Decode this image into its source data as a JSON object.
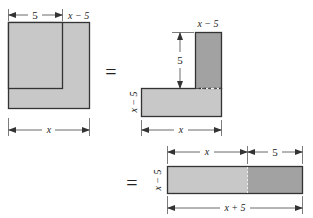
{
  "colors": {
    "light_fill": "#c8c8c8",
    "dark_fill": "#a2a2a2",
    "stroke": "#333333",
    "dim_line": "#444444"
  },
  "figure1": {
    "dim_top": "5",
    "dim_corner": "x − 5",
    "dim_bottom": "x"
  },
  "equals1": "=",
  "figure2": {
    "dim_top": "x − 5",
    "dim_vertical": "5",
    "dim_side": "x − 5",
    "dim_bottom": "x"
  },
  "equals2": "=",
  "figure3": {
    "dim_top_left": "x",
    "dim_top_right": "5",
    "dim_side": "x − 5",
    "dim_bottom": "x + 5"
  }
}
